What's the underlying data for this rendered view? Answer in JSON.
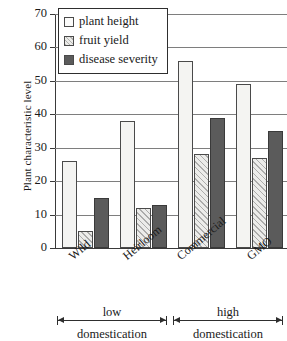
{
  "chart_data": {
    "type": "bar",
    "title": "",
    "xlabel": "",
    "ylabel": "Plant characteristic level",
    "ylim": [
      0,
      70
    ],
    "yticks": [
      0,
      10,
      20,
      30,
      40,
      50,
      60,
      70
    ],
    "grid": true,
    "legend_position": "top-left",
    "categories": [
      "Wild",
      "Heirloom",
      "Commercial",
      "GMO"
    ],
    "series": [
      {
        "name": "plant height",
        "values": [
          26,
          38,
          56,
          49
        ]
      },
      {
        "name": "fruit yield",
        "values": [
          5,
          12,
          28,
          27
        ]
      },
      {
        "name": "disease severity",
        "values": [
          15,
          13,
          39,
          35
        ]
      }
    ],
    "annotations": [
      {
        "label_line1": "low",
        "label_line2": "domestication",
        "covers": [
          "Wild",
          "Heirloom"
        ]
      },
      {
        "label_line1": "high",
        "label_line2": "domestication",
        "covers": [
          "Commercial",
          "GMO"
        ]
      }
    ],
    "colors": {
      "plant_height": "#f4f4f2",
      "fruit_yield": "#ececea",
      "disease_severity": "#5b5b5b",
      "axis": "#3a3a3a",
      "grid": "#7e7e7e",
      "background": "#ffffff"
    }
  }
}
